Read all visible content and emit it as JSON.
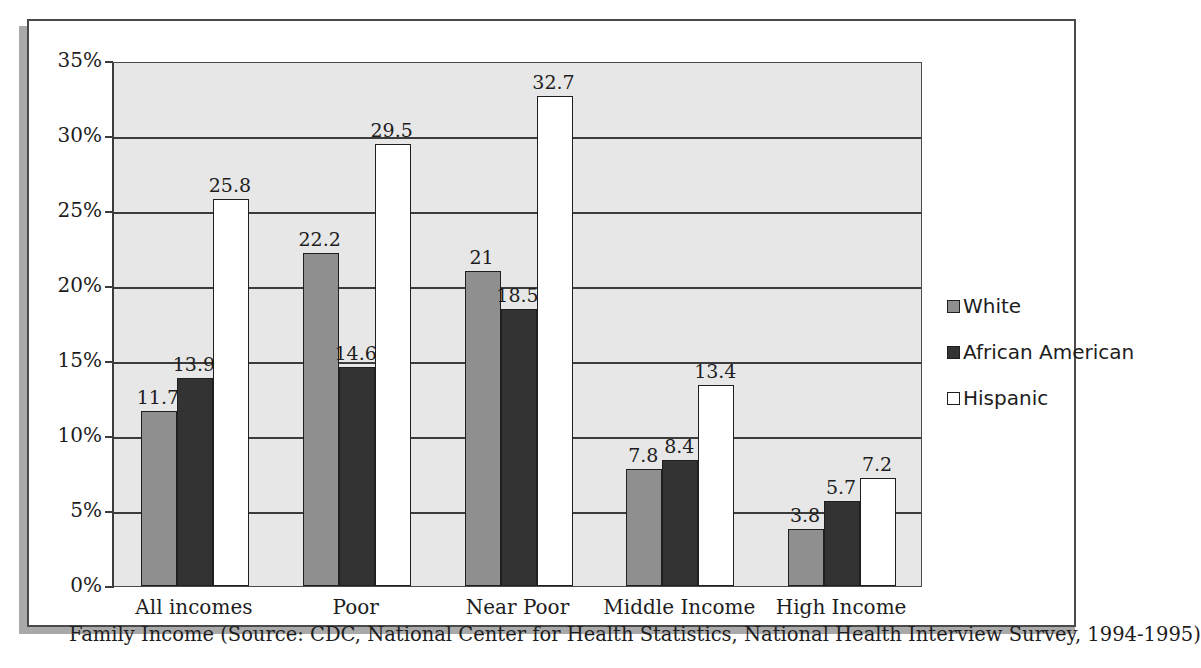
{
  "chart_data": {
    "type": "bar",
    "title": "",
    "xlabel": "Family Income (Source: CDC, National Center for Health Statistics, National Health Interview Survey, 1994-1995)",
    "ylabel": "",
    "ylim": [
      0,
      35
    ],
    "ytick_step": 5,
    "ytick_labels": [
      "0%",
      "5%",
      "10%",
      "15%",
      "20%",
      "25%",
      "30%",
      "35%"
    ],
    "grid": true,
    "legend_position": "right",
    "categories": [
      "All incomes",
      "Poor",
      "Near Poor",
      "Middle Income",
      "High Income"
    ],
    "series": [
      {
        "name": "White",
        "color": "#8f8f8f",
        "values": [
          11.7,
          22.2,
          21,
          7.8,
          3.8
        ],
        "labels": [
          "11.7",
          "22.2",
          "21",
          "7.8",
          "3.8"
        ]
      },
      {
        "name": "African American",
        "color": "#333333",
        "values": [
          13.9,
          14.6,
          18.5,
          8.4,
          5.7
        ],
        "labels": [
          "13.9",
          "14.6",
          "18.5",
          "8.4",
          "5.7"
        ]
      },
      {
        "name": "Hispanic",
        "color": "#ffffff",
        "values": [
          25.8,
          29.5,
          32.7,
          13.4,
          7.2
        ],
        "labels": [
          "25.8",
          "29.5",
          "32.7",
          "13.4",
          "7.2"
        ]
      }
    ]
  },
  "caption": {
    "text": "Family Income (Source: CDC, National Center for Health Statistics, National Health Interview Survey, 1994-1995)"
  },
  "legend": {
    "items": [
      {
        "label": "White",
        "swatch": "gray"
      },
      {
        "label": "African American",
        "swatch": "dark"
      },
      {
        "label": "Hispanic",
        "swatch": "white"
      }
    ]
  },
  "axis": {
    "y_labels": [
      "35%",
      "30%",
      "25%",
      "20%",
      "15%",
      "10%",
      "5%",
      "0%"
    ],
    "x_labels": [
      "All incomes",
      "Poor",
      "Near Poor",
      "Middle Income",
      "High Income"
    ]
  },
  "colors": {
    "plot_background": "#e7e7e7",
    "gridline": "#3c3c3c",
    "frame_border": "#4a4a4a",
    "shadow": "#a9a9a9",
    "text": "#1d1d1d"
  }
}
